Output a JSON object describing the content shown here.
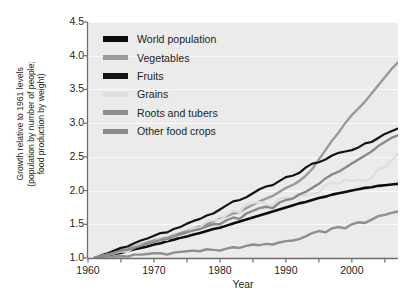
{
  "chart_data": {
    "type": "line",
    "title": "",
    "xlabel": "Year",
    "ylabel": "Growth relative to 1961 levels\n(population by number of people;\nfood production by weight)",
    "xlim": [
      1960,
      2007
    ],
    "ylim": [
      1.0,
      4.5
    ],
    "xticks": [
      1960,
      1970,
      1980,
      1990,
      2000
    ],
    "xticklabels": [
      "1960",
      "1970",
      "1980",
      "1990",
      "2000"
    ],
    "xminorticks": [
      1965,
      1975,
      1985,
      1995,
      2005
    ],
    "yticks": [
      1.0,
      1.5,
      2.0,
      2.5,
      3.0,
      3.5,
      4.0,
      4.5
    ],
    "yticklabels": [
      "1.0",
      "1.5",
      "2.0",
      "2.5",
      "3.0",
      "3.5",
      "4.0",
      "4.5"
    ],
    "grid": "horizontal-white",
    "plot_background": "#ebebeb",
    "legend_position": "top-left-inside",
    "x": [
      1961,
      1962,
      1963,
      1964,
      1965,
      1966,
      1967,
      1968,
      1969,
      1970,
      1971,
      1972,
      1973,
      1974,
      1975,
      1976,
      1977,
      1978,
      1979,
      1980,
      1981,
      1982,
      1983,
      1984,
      1985,
      1986,
      1987,
      1988,
      1989,
      1990,
      1991,
      1992,
      1993,
      1994,
      1995,
      1996,
      1997,
      1998,
      1999,
      2000,
      2001,
      2002,
      2003,
      2004,
      2005,
      2006,
      2007
    ],
    "series": [
      {
        "name": "World population",
        "color": "#0d0d0d",
        "width": 2.6,
        "values": [
          1.0,
          1.02,
          1.04,
          1.06,
          1.08,
          1.1,
          1.13,
          1.15,
          1.17,
          1.2,
          1.22,
          1.25,
          1.27,
          1.3,
          1.32,
          1.35,
          1.37,
          1.4,
          1.43,
          1.45,
          1.48,
          1.51,
          1.54,
          1.57,
          1.6,
          1.63,
          1.66,
          1.69,
          1.72,
          1.75,
          1.78,
          1.81,
          1.83,
          1.86,
          1.89,
          1.91,
          1.94,
          1.96,
          1.98,
          2.0,
          2.02,
          2.04,
          2.05,
          2.07,
          2.08,
          2.09,
          2.1
        ]
      },
      {
        "name": "Vegetables",
        "color": "#9a9a9a",
        "width": 2.4,
        "values": [
          1.0,
          1.03,
          1.06,
          1.09,
          1.12,
          1.13,
          1.17,
          1.2,
          1.23,
          1.26,
          1.29,
          1.3,
          1.34,
          1.37,
          1.4,
          1.44,
          1.47,
          1.5,
          1.54,
          1.58,
          1.62,
          1.66,
          1.68,
          1.74,
          1.79,
          1.84,
          1.88,
          1.92,
          1.98,
          2.04,
          2.08,
          2.14,
          2.22,
          2.32,
          2.46,
          2.6,
          2.74,
          2.86,
          3.0,
          3.12,
          3.22,
          3.32,
          3.44,
          3.56,
          3.68,
          3.8,
          3.9
        ]
      },
      {
        "name": "Fruits",
        "color": "#131313",
        "width": 2.2,
        "values": [
          1.0,
          1.04,
          1.07,
          1.11,
          1.15,
          1.17,
          1.22,
          1.26,
          1.29,
          1.33,
          1.37,
          1.38,
          1.43,
          1.46,
          1.51,
          1.55,
          1.58,
          1.63,
          1.66,
          1.72,
          1.78,
          1.84,
          1.86,
          1.9,
          1.96,
          2.02,
          2.06,
          2.08,
          2.14,
          2.2,
          2.22,
          2.26,
          2.34,
          2.4,
          2.42,
          2.46,
          2.52,
          2.56,
          2.58,
          2.6,
          2.64,
          2.7,
          2.72,
          2.78,
          2.84,
          2.88,
          2.92
        ]
      },
      {
        "name": "Grains",
        "color": "#dedede",
        "width": 2.4,
        "values": [
          1.0,
          1.03,
          1.05,
          1.07,
          1.1,
          1.09,
          1.16,
          1.19,
          1.21,
          1.24,
          1.29,
          1.27,
          1.33,
          1.33,
          1.38,
          1.44,
          1.45,
          1.55,
          1.56,
          1.56,
          1.64,
          1.7,
          1.68,
          1.8,
          1.82,
          1.83,
          1.8,
          1.78,
          1.88,
          1.9,
          1.88,
          1.95,
          1.92,
          1.96,
          1.96,
          2.08,
          2.12,
          2.1,
          2.16,
          2.14,
          2.16,
          2.14,
          2.18,
          2.32,
          2.34,
          2.44,
          2.55
        ]
      },
      {
        "name": "Roots and tubers",
        "color": "#8f8f8f",
        "width": 2.4,
        "values": [
          1.0,
          1.01,
          1.02,
          1.02,
          1.03,
          1.02,
          1.05,
          1.05,
          1.06,
          1.07,
          1.07,
          1.05,
          1.08,
          1.09,
          1.1,
          1.11,
          1.1,
          1.13,
          1.12,
          1.11,
          1.14,
          1.16,
          1.15,
          1.18,
          1.2,
          1.19,
          1.21,
          1.2,
          1.23,
          1.25,
          1.26,
          1.28,
          1.32,
          1.37,
          1.4,
          1.38,
          1.44,
          1.46,
          1.44,
          1.5,
          1.53,
          1.52,
          1.57,
          1.62,
          1.64,
          1.67,
          1.69
        ]
      },
      {
        "name": "Other food crops",
        "color": "#8a8a8a",
        "width": 2.4,
        "values": [
          1.0,
          1.03,
          1.05,
          1.08,
          1.11,
          1.12,
          1.15,
          1.18,
          1.21,
          1.24,
          1.27,
          1.28,
          1.32,
          1.35,
          1.38,
          1.41,
          1.43,
          1.47,
          1.5,
          1.5,
          1.56,
          1.6,
          1.58,
          1.66,
          1.7,
          1.74,
          1.76,
          1.74,
          1.82,
          1.86,
          1.88,
          1.94,
          1.98,
          2.04,
          2.1,
          2.18,
          2.24,
          2.28,
          2.34,
          2.4,
          2.46,
          2.52,
          2.58,
          2.66,
          2.72,
          2.78,
          2.82
        ]
      }
    ]
  },
  "legend": {
    "items": [
      {
        "label": "World population",
        "color": "#0d0d0d",
        "thick": true
      },
      {
        "label": "Vegetables",
        "color": "#9a9a9a",
        "thick": false
      },
      {
        "label": "Fruits",
        "color": "#131313",
        "thick": true
      },
      {
        "label": "Grains",
        "color": "#dedede",
        "thick": false
      },
      {
        "label": "Roots and tubers",
        "color": "#8f8f8f",
        "thick": false
      },
      {
        "label": "Other food crops",
        "color": "#8a8a8a",
        "thick": false
      }
    ]
  }
}
